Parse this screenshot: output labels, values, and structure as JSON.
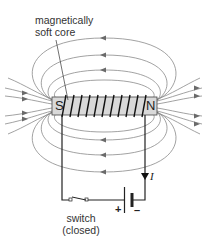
{
  "labels": {
    "core_label_line1": "magnetically",
    "core_label_line2": "soft core",
    "south_pole": "S",
    "north_pole": "N",
    "current": "I",
    "battery_plus": "+",
    "battery_minus": "–",
    "switch_line1": "switch",
    "switch_line2": "(closed)"
  },
  "colors": {
    "field_lines": "#7a7a7a",
    "core_fill": "#d9d9d9",
    "wire": "#222222",
    "text": "#333333"
  }
}
